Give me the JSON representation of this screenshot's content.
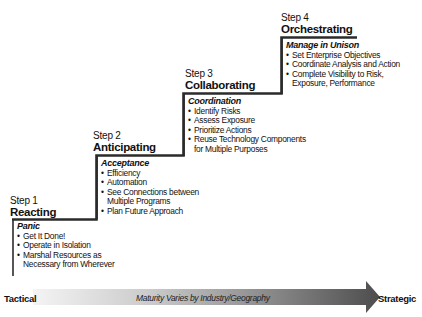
{
  "steps": [
    {
      "number": "Step 1",
      "name": "Reacting",
      "category": "Panic",
      "items": [
        "Get It Done!",
        "Operate in Isolation",
        "Marshal Resources as\nNecessary from Wherever"
      ],
      "items_lines": [
        [
          "Get It Done!"
        ],
        [
          "Operate in Isolation"
        ],
        [
          "Marshal Resources as",
          "Necessary from Wherever"
        ]
      ]
    },
    {
      "number": "Step 2",
      "name": "Anticipating",
      "category": "Acceptance",
      "items_lines": [
        [
          "Efficiency"
        ],
        [
          "Automation"
        ],
        [
          "See Connections between",
          "Multiple Programs"
        ],
        [
          "Plan Future Approach"
        ]
      ]
    },
    {
      "number": "Step 3",
      "name": "Collaborating",
      "category": "Coordination",
      "items_lines": [
        [
          "Identify Risks"
        ],
        [
          "Assess Exposure"
        ],
        [
          "Prioritize Actions"
        ],
        [
          "Reuse Technology Components",
          "for Multiple Purposes"
        ]
      ]
    },
    {
      "number": "Step 4",
      "name": "Orchestrating",
      "category": "Manage in Unison",
      "items_lines": [
        [
          "Set Enterprise Objectives"
        ],
        [
          "Coordinate Analysis and Action"
        ],
        [
          "Complete Visibility to Risk,",
          "Exposure, Performance"
        ]
      ]
    }
  ],
  "axis": {
    "left_label": "Tactical",
    "middle_label": "Maturity Varies by Industry/Geography",
    "right_label": "Strategic"
  },
  "colors": {
    "line": "#2b2b2b",
    "arrow_start": "#f2f2f2",
    "arrow_end": "#555555"
  }
}
